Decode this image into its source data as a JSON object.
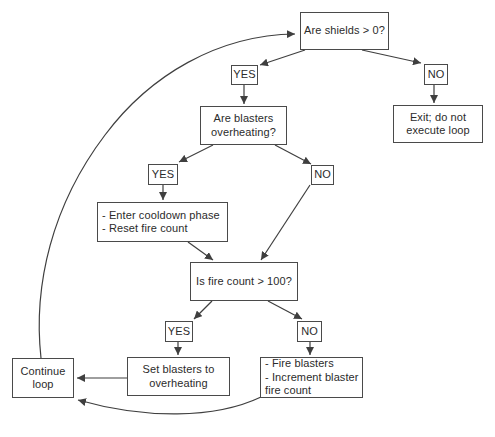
{
  "diagram": {
    "colors": {
      "background": "#ffffff",
      "line": "#3f3f3f",
      "box_border": "#4a4a4a",
      "box_fill": "#ffffff",
      "text": "#2b2b2b"
    },
    "nodes": {
      "are_shields": {
        "label": "Are shields > 0?"
      },
      "yes_shields": {
        "label": "YES"
      },
      "no_shields": {
        "label": "NO"
      },
      "exit_loop": {
        "label": "Exit; do not\nexecute loop"
      },
      "are_blasters": {
        "label": "Are blasters\noverheating?"
      },
      "yes_blasters": {
        "label": "YES"
      },
      "no_blasters": {
        "label": "NO"
      },
      "cooldown": {
        "label": "- Enter cooldown phase\n- Reset fire count"
      },
      "fire_count": {
        "label": "Is fire count > 100?"
      },
      "yes_fire_count": {
        "label": "YES"
      },
      "no_fire_count": {
        "label": "NO"
      },
      "set_overheating": {
        "label": "Set blasters to\noverheating"
      },
      "fire_blasters": {
        "label": "- Fire blasters\n- Increment blaster\nfire count"
      },
      "continue_loop": {
        "label": "Continue\nloop"
      }
    },
    "edges": [
      {
        "from": "are_shields",
        "to": "yes_shields"
      },
      {
        "from": "are_shields",
        "to": "no_shields"
      },
      {
        "from": "no_shields",
        "to": "exit_loop"
      },
      {
        "from": "yes_shields",
        "to": "are_blasters"
      },
      {
        "from": "are_blasters",
        "to": "yes_blasters"
      },
      {
        "from": "are_blasters",
        "to": "no_blasters"
      },
      {
        "from": "yes_blasters",
        "to": "cooldown"
      },
      {
        "from": "cooldown",
        "to": "fire_count"
      },
      {
        "from": "no_blasters",
        "to": "fire_count"
      },
      {
        "from": "fire_count",
        "to": "yes_fire_count"
      },
      {
        "from": "fire_count",
        "to": "no_fire_count"
      },
      {
        "from": "yes_fire_count",
        "to": "set_overheating"
      },
      {
        "from": "no_fire_count",
        "to": "fire_blasters"
      },
      {
        "from": "set_overheating",
        "to": "continue_loop"
      },
      {
        "from": "fire_blasters",
        "to": "continue_loop"
      },
      {
        "from": "continue_loop",
        "to": "are_shields"
      }
    ]
  }
}
